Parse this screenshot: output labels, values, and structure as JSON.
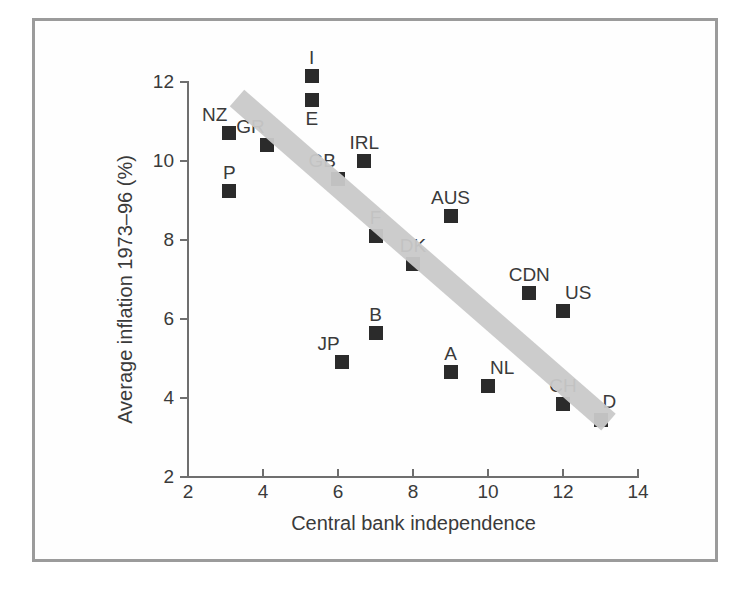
{
  "chart_data": {
    "type": "scatter",
    "title": "",
    "xlabel": "Central bank independence",
    "ylabel": "Average inflation 1973–96 (%)",
    "xlim": [
      2,
      14
    ],
    "ylim": [
      2,
      12
    ],
    "xticks": [
      "2",
      "4",
      "6",
      "8",
      "10",
      "12",
      "14"
    ],
    "yticks": [
      "12",
      "10",
      "8",
      "6",
      "4",
      "2"
    ],
    "grid": false,
    "legend": "none",
    "trendline": {
      "type": "band",
      "description": "thick grey negatively-sloped band",
      "from": [
        3.3,
        11.6
      ],
      "to": [
        13.2,
        3.4
      ],
      "color": "#c9c9c9"
    },
    "marker_color": "#2b2b2b",
    "points": [
      {
        "label": "NZ",
        "x": 3.1,
        "y": 10.7,
        "label_pos": "above-left"
      },
      {
        "label": "P",
        "x": 3.1,
        "y": 9.25,
        "label_pos": "above"
      },
      {
        "label": "GR",
        "x": 4.1,
        "y": 10.4,
        "label_pos": "above-left"
      },
      {
        "label": "I",
        "x": 5.3,
        "y": 12.15,
        "label_pos": "above"
      },
      {
        "label": "E",
        "x": 5.3,
        "y": 11.55,
        "label_pos": "below"
      },
      {
        "label": "GB",
        "x": 6.0,
        "y": 9.55,
        "label_pos": "above-left"
      },
      {
        "label": "IRL",
        "x": 6.7,
        "y": 10.0,
        "label_pos": "above"
      },
      {
        "label": "JP",
        "x": 6.1,
        "y": 4.9,
        "label_pos": "above-left"
      },
      {
        "label": "B",
        "x": 7.0,
        "y": 5.65,
        "label_pos": "above"
      },
      {
        "label": "F",
        "x": 7.0,
        "y": 8.1,
        "label_pos": "above"
      },
      {
        "label": "DK",
        "x": 8.0,
        "y": 7.4,
        "label_pos": "above"
      },
      {
        "label": "AUS",
        "x": 9.0,
        "y": 8.6,
        "label_pos": "above"
      },
      {
        "label": "A",
        "x": 9.0,
        "y": 4.65,
        "label_pos": "above"
      },
      {
        "label": "NL",
        "x": 10.0,
        "y": 4.3,
        "label_pos": "above-right"
      },
      {
        "label": "CDN",
        "x": 11.1,
        "y": 6.65,
        "label_pos": "above"
      },
      {
        "label": "US",
        "x": 12.0,
        "y": 6.2,
        "label_pos": "above-right"
      },
      {
        "label": "CH",
        "x": 12.0,
        "y": 3.85,
        "label_pos": "above"
      },
      {
        "label": "D",
        "x": 13.0,
        "y": 3.45,
        "label_pos": "above-right"
      }
    ]
  }
}
